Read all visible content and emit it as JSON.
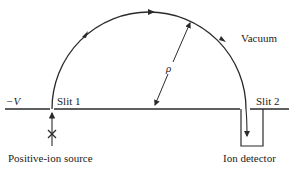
{
  "diagram": {
    "labels": {
      "voltage": "−V",
      "slit1": "Slit 1",
      "slit2": "Slit 2",
      "vacuum": "Vacuum",
      "radius": "ρ",
      "source": "Positive-ion source",
      "detector": "Ion detector"
    },
    "colors": {
      "stroke": "#2a2a2a",
      "text": "#222222",
      "background": "#ffffff"
    }
  }
}
